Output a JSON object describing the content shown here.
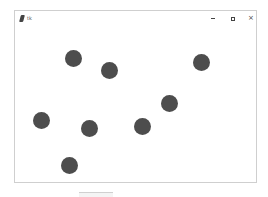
{
  "window": {
    "title": "tk",
    "controls": {
      "minimize": "–",
      "maximize": "□",
      "close": "×"
    }
  },
  "canvas": {
    "background": "#ffffff",
    "dot_color": "#4d4d4d",
    "dot_diameter": 17,
    "dots": [
      {
        "x": 73,
        "y": 58
      },
      {
        "x": 109,
        "y": 70
      },
      {
        "x": 201,
        "y": 62
      },
      {
        "x": 169,
        "y": 103
      },
      {
        "x": 142,
        "y": 126
      },
      {
        "x": 89,
        "y": 128
      },
      {
        "x": 41,
        "y": 120
      },
      {
        "x": 69,
        "y": 165
      }
    ]
  }
}
